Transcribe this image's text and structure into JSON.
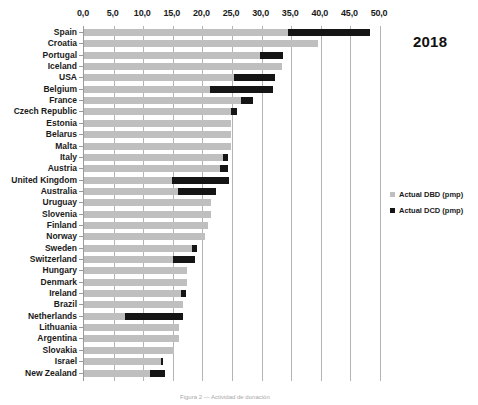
{
  "chart_data": {
    "type": "bar",
    "orientation": "horizontal",
    "stacked": true,
    "title": "",
    "annotation": "2018",
    "xlabel": "",
    "ylabel": "",
    "xlim": [
      0,
      50
    ],
    "xticks": [
      "0,0",
      "5,0",
      "10,0",
      "15,0",
      "20,0",
      "25,0",
      "30,0",
      "35,0",
      "40,0",
      "45,0",
      "50,0"
    ],
    "xtick_values": [
      0,
      5,
      10,
      15,
      20,
      25,
      30,
      35,
      40,
      45,
      50
    ],
    "grid": true,
    "legend_position": "right",
    "categories": [
      "Spain",
      "Croatia",
      "Portugal",
      "Iceland",
      "USA",
      "Belgium",
      "France",
      "Czech Republic",
      "Estonia",
      "Belarus",
      "Malta",
      "Italy",
      "Austria",
      "United Kingdom",
      "Australia",
      "Uruguay",
      "Slovenia",
      "Finland",
      "Norway",
      "Sweden",
      "Switzerland",
      "Hungary",
      "Denmark",
      "Ireland",
      "Brazil",
      "Netherlands",
      "Lithuania",
      "Argentina",
      "Slovakia",
      "Israel",
      "New Zealand"
    ],
    "series": [
      {
        "name": "Actual DBD (pmp)",
        "color": "#bfbfbf",
        "values": [
          34.4,
          39.6,
          29.7,
          33.5,
          25.4,
          21.2,
          26.6,
          24.9,
          24.9,
          24.9,
          24.9,
          23.5,
          22.9,
          14.8,
          15.9,
          21.5,
          21.4,
          21.0,
          20.5,
          18.3,
          15.1,
          17.4,
          17.4,
          16.4,
          16.8,
          6.9,
          16.1,
          16.1,
          15.2,
          13.0,
          11.2
        ]
      },
      {
        "name": "Actual DCD (pmp)",
        "color": "#151515",
        "values": [
          13.9,
          0.0,
          3.9,
          0.0,
          6.8,
          10.8,
          2.0,
          0.9,
          0.0,
          0.0,
          0.0,
          0.9,
          1.5,
          9.7,
          6.4,
          0.0,
          0.0,
          0.0,
          0.0,
          0.8,
          3.7,
          0.0,
          0.0,
          0.9,
          0.0,
          9.8,
          0.0,
          0.0,
          0.0,
          0.4,
          2.4
        ]
      }
    ],
    "legend": [
      {
        "label": "Actual DBD (pmp)",
        "color": "#bfbfbf",
        "marker": "square"
      },
      {
        "label": "Actual DCD (pmp)",
        "color": "#151515",
        "marker": "square"
      }
    ]
  },
  "bottom_caption": "Figura 2 — Actividad de donación"
}
